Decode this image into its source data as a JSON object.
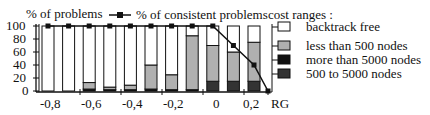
{
  "chart_data": {
    "type": "bar",
    "subtype": "stacked-percent-with-line",
    "title": "",
    "ylabel": "% of problems",
    "xlabel": "",
    "ylim": [
      0,
      100
    ],
    "yticks": [
      "0",
      "20",
      "40",
      "60",
      "80",
      "100"
    ],
    "xticks": [
      "-0,8",
      "-0,6",
      "-0,4",
      "-0,2",
      "0",
      "0,2",
      "RG"
    ],
    "categories": [
      "b1",
      "b2",
      "b3",
      "b4",
      "b5",
      "b6",
      "b7",
      "b8",
      "b9",
      "b10",
      "b11"
    ],
    "series": [
      {
        "name": "500 to 5000 nodes",
        "color": "#333333",
        "values": [
          0,
          0,
          0,
          0,
          0,
          0,
          0,
          0,
          15,
          15,
          15
        ]
      },
      {
        "name": "more than 5000 nodes",
        "color": "#111111",
        "values": [
          0,
          0,
          3,
          2,
          2,
          3,
          2,
          2,
          0,
          0,
          0
        ]
      },
      {
        "name": "less than 500 nodes",
        "color": "#b0b0b0",
        "values": [
          0,
          0,
          10,
          4,
          7,
          37,
          23,
          83,
          55,
          45,
          60
        ]
      },
      {
        "name": "backtrack free",
        "color": "#ffffff",
        "values": [
          100,
          100,
          87,
          94,
          91,
          60,
          75,
          15,
          30,
          40,
          25
        ]
      }
    ],
    "line_series": {
      "name": "% of consistent problems",
      "points": [
        [
          0,
          100
        ],
        [
          1,
          100
        ],
        [
          2,
          100
        ],
        [
          3,
          100
        ],
        [
          4,
          100
        ],
        [
          5,
          100
        ],
        [
          6,
          100
        ],
        [
          7,
          100
        ],
        [
          8,
          100
        ],
        [
          9,
          70
        ],
        [
          10,
          40
        ],
        [
          11,
          0
        ]
      ]
    },
    "legend": {
      "title": "cost ranges :",
      "position": "right",
      "entries": [
        "backtrack free",
        "less than 500 nodes",
        "more than 5000 nodes",
        "500 to 5000 nodes"
      ]
    },
    "grid": false
  },
  "labels": {
    "ylabel": "% of problems",
    "line_legend": "% of consistent problems",
    "legend_title": "cost ranges :",
    "legend_1": "backtrack free",
    "legend_2": "less than 500 nodes",
    "legend_3": "more than 5000 nodes",
    "legend_4": "500 to 5000 nodes",
    "y0": "0",
    "y20": "20",
    "y40": "40",
    "y60": "60",
    "y80": "80",
    "y100": "100",
    "x1": "-0,8",
    "x2": "-0,6",
    "x3": "-0,4",
    "x4": "-0,2",
    "x5": "0",
    "x6": "0,2",
    "x7": "RG"
  }
}
